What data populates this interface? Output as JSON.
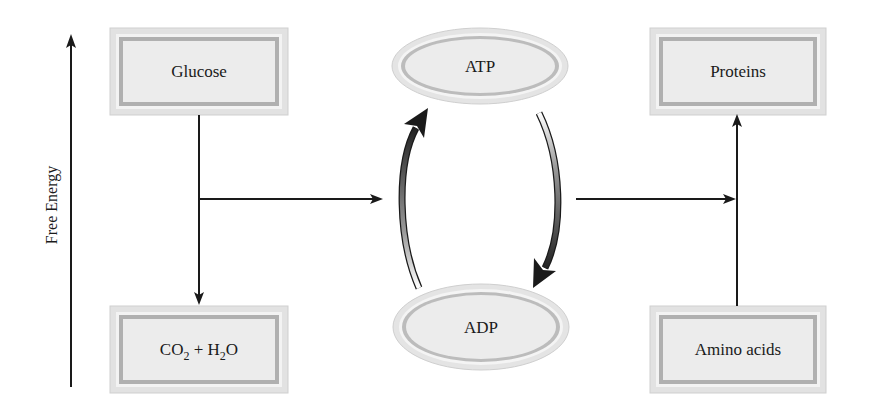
{
  "diagram": {
    "axis": {
      "label": "Free Energy",
      "direction": "up"
    },
    "nodes": {
      "glucose": {
        "label": "Glucose",
        "shape": "box",
        "level": "high"
      },
      "co2_h2o": {
        "label_parts": [
          "CO",
          "2",
          " + H",
          "2",
          "O"
        ],
        "label": "CO2 + H2O",
        "shape": "box",
        "level": "low"
      },
      "atp": {
        "label": "ATP",
        "shape": "ellipse",
        "level": "high"
      },
      "adp": {
        "label": "ADP",
        "shape": "ellipse",
        "level": "low"
      },
      "proteins": {
        "label": "Proteins",
        "shape": "box",
        "level": "high"
      },
      "amino_acids": {
        "label": "Amino acids",
        "shape": "box",
        "level": "low"
      }
    },
    "edges": [
      {
        "from": "Glucose",
        "to": "CO2 + H2O",
        "type": "straight-arrow"
      },
      {
        "from": "Glucose→CO2 + H2O",
        "to": "ADP→ATP cycle",
        "type": "straight-arrow"
      },
      {
        "from": "ADP",
        "to": "ATP",
        "type": "curved-gradient-arrow"
      },
      {
        "from": "ATP",
        "to": "ADP",
        "type": "curved-gradient-arrow"
      },
      {
        "from": "ATP→ADP cycle",
        "to": "Amino acids→Proteins",
        "type": "straight-arrow"
      },
      {
        "from": "Amino acids",
        "to": "Proteins",
        "type": "straight-arrow"
      }
    ],
    "colors": {
      "box_fill": "#ececec",
      "box_band": "#b3b3b3",
      "box_outer": "#d6d6d6",
      "line": "#1a1a1a",
      "arrow_dark": "#2a2a2a",
      "arrow_light": "#ffffff"
    }
  }
}
